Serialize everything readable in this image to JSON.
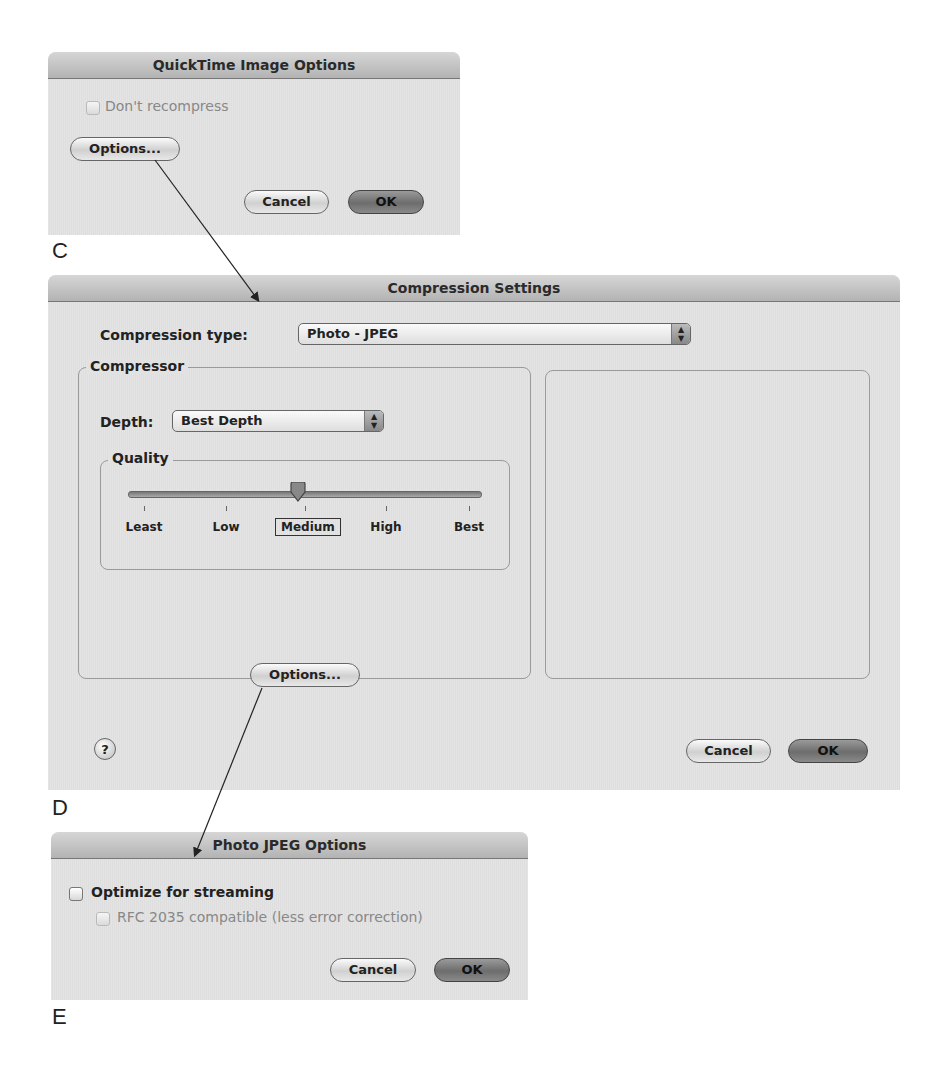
{
  "dialog_c": {
    "title": "QuickTime Image Options",
    "figure_label": "C",
    "dont_recompress": {
      "label": "Don't recompress",
      "checked": false,
      "enabled": false
    },
    "options_button": "Options...",
    "cancel_button": "Cancel",
    "ok_button": "OK"
  },
  "dialog_d": {
    "title": "Compression Settings",
    "figure_label": "D",
    "compression_type_label": "Compression type:",
    "compression_type_value": "Photo - JPEG",
    "compressor_group": "Compressor",
    "depth_label": "Depth:",
    "depth_value": "Best Depth",
    "quality_group": "Quality",
    "quality_ticks": [
      "Least",
      "Low",
      "Medium",
      "High",
      "Best"
    ],
    "quality_selected": "Medium",
    "options_button": "Options...",
    "help_button": "?",
    "cancel_button": "Cancel",
    "ok_button": "OK"
  },
  "dialog_e": {
    "title": "Photo JPEG Options",
    "figure_label": "E",
    "optimize_streaming": {
      "label": "Optimize for streaming",
      "checked": false,
      "enabled": true
    },
    "rfc_compatible": {
      "label": "RFC 2035 compatible (less error correction)",
      "checked": false,
      "enabled": false
    },
    "cancel_button": "Cancel",
    "ok_button": "OK"
  },
  "icons": {
    "popup_arrows": "▲▼",
    "help": "question-mark"
  }
}
